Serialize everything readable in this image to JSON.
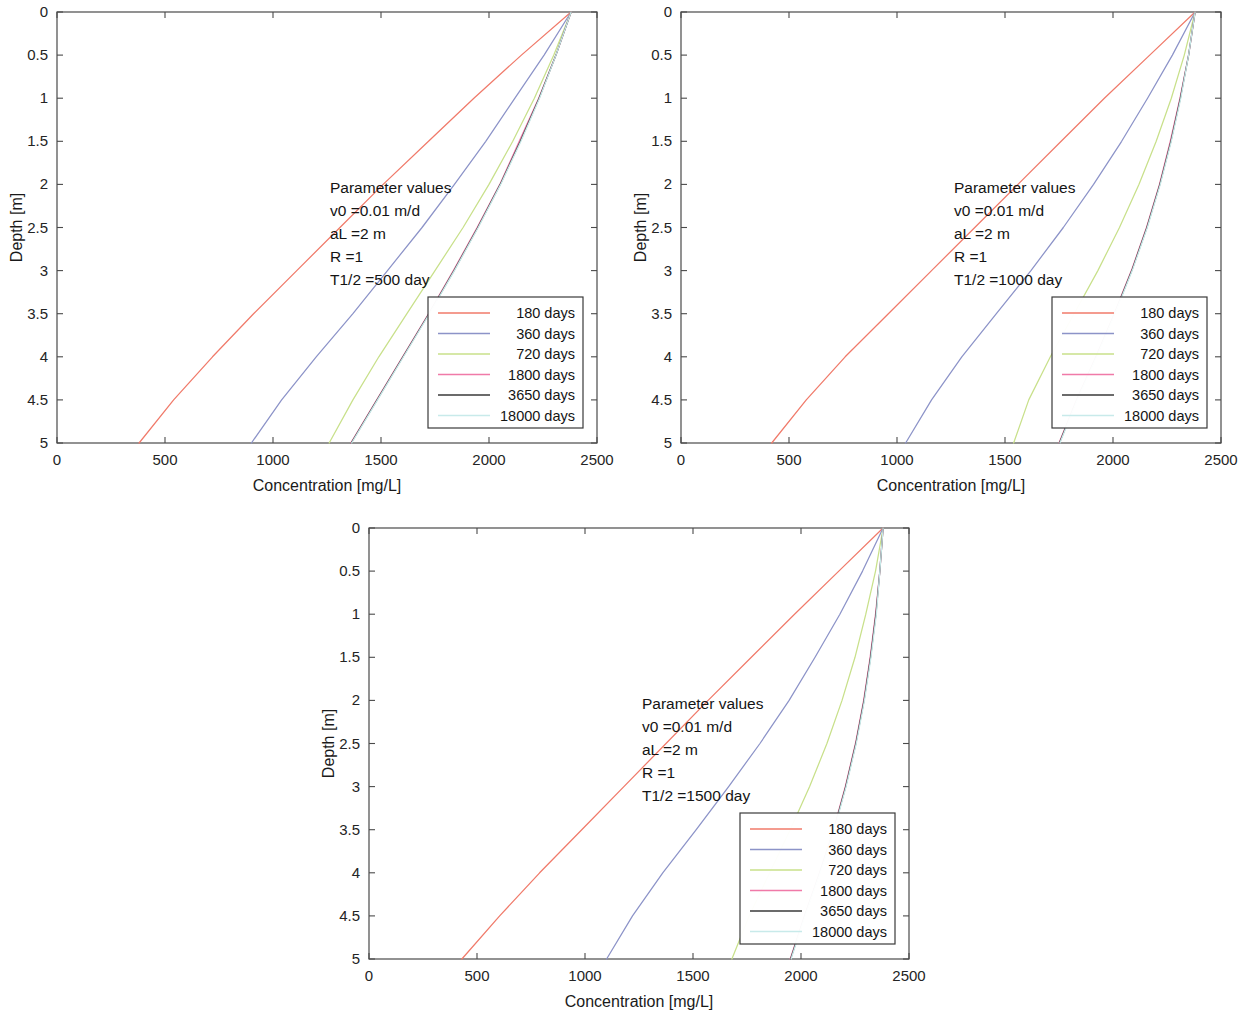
{
  "axes": {
    "xlabel": "Concentration [mg/L]",
    "ylabel": "Depth [m]",
    "xlim": [
      0,
      2500
    ],
    "ylim": [
      0,
      5
    ],
    "xticks": [
      0,
      500,
      1000,
      1500,
      2000,
      2500
    ],
    "xtick_labels": [
      "0",
      "500",
      "1000",
      "1500",
      "2000",
      "2500"
    ],
    "yticks": [
      0,
      0.5,
      1,
      1.5,
      2,
      2.5,
      3,
      3.5,
      4,
      4.5,
      5
    ],
    "ytick_labels": [
      "0",
      "0.5",
      "1",
      "1.5",
      "2",
      "2.5",
      "3",
      "3.5",
      "4",
      "4.5",
      "5"
    ],
    "grid": false
  },
  "series_colors": {
    "180": "#f07a6a",
    "360": "#8c93c8",
    "720": "#c8e08a",
    "1800": "#f07aa8",
    "3650": "#3a3a3a",
    "18000": "#c8eaea"
  },
  "legend": {
    "position": "lower-right-inside",
    "entries": [
      {
        "label": "180 days",
        "color_key": "180"
      },
      {
        "label": "360 days",
        "color_key": "360"
      },
      {
        "label": "720 days",
        "color_key": "720"
      },
      {
        "label": "1800 days",
        "color_key": "1800"
      },
      {
        "label": "3650 days",
        "color_key": "3650"
      },
      {
        "label": "18000 days",
        "color_key": "18000"
      }
    ]
  },
  "panels": [
    {
      "id": "panel-1",
      "param_title": "Parameter values",
      "param_lines": [
        "v0 =0.01 m/d",
        "aL =2 m",
        "R =1",
        "T1/2 =500 day"
      ],
      "half_life_day": 500,
      "chart_data": {
        "type": "line",
        "title": "",
        "xlabel": "Concentration [mg/L]",
        "ylabel": "Depth [m]",
        "xlim": [
          0,
          2500
        ],
        "ylim": [
          0,
          5
        ],
        "y_inverted": true,
        "depths_m": [
          0,
          0.5,
          1,
          1.5,
          2,
          2.5,
          3,
          3.5,
          4,
          4.5,
          5
        ],
        "series": [
          {
            "name": "180 days",
            "values": [
              2380,
              2150,
              1930,
              1720,
              1510,
              1310,
              1110,
              910,
              720,
              540,
              380
            ]
          },
          {
            "name": "360 days",
            "values": [
              2380,
              2255,
              2120,
              1985,
              1840,
              1690,
              1530,
              1370,
              1200,
              1040,
              900
            ]
          },
          {
            "name": "720 days",
            "values": [
              2380,
              2300,
              2210,
              2110,
              2000,
              1880,
              1750,
              1620,
              1490,
              1370,
              1260
            ]
          },
          {
            "name": "1800 days",
            "values": [
              2380,
              2310,
              2230,
              2140,
              2050,
              1945,
              1835,
              1720,
              1600,
              1480,
              1360
            ]
          },
          {
            "name": "3650 days",
            "values": [
              2380,
              2310,
              2232,
              2145,
              2052,
              1948,
              1838,
              1722,
              1602,
              1482,
              1362
            ]
          },
          {
            "name": "18000 days",
            "values": [
              2380,
              2310,
              2234,
              2148,
              2054,
              1950,
              1840,
              1724,
              1604,
              1484,
              1364
            ]
          }
        ]
      }
    },
    {
      "id": "panel-2",
      "param_title": "Parameter values",
      "param_lines": [
        "v0 =0.01 m/d",
        "aL =2 m",
        "R =1",
        "T1/2 =1000 day"
      ],
      "half_life_day": 1000,
      "chart_data": {
        "type": "line",
        "title": "",
        "xlabel": "Concentration [mg/L]",
        "ylabel": "Depth [m]",
        "xlim": [
          0,
          2500
        ],
        "ylim": [
          0,
          5
        ],
        "y_inverted": true,
        "depths_m": [
          0,
          0.5,
          1,
          1.5,
          2,
          2.5,
          3,
          3.5,
          4,
          4.5,
          5
        ],
        "series": [
          {
            "name": "180 days",
            "values": [
              2380,
              2170,
              1960,
              1760,
              1560,
              1360,
              1160,
              960,
              760,
              580,
              420
            ]
          },
          {
            "name": "360 days",
            "values": [
              2380,
              2275,
              2160,
              2040,
              1910,
              1770,
              1620,
              1460,
              1300,
              1160,
              1040
            ]
          },
          {
            "name": "720 days",
            "values": [
              2380,
              2330,
              2270,
              2200,
              2120,
              2030,
              1930,
              1820,
              1710,
              1610,
              1540
            ]
          },
          {
            "name": "1800 days",
            "values": [
              2380,
              2350,
              2310,
              2265,
              2215,
              2155,
              2085,
              2005,
              1920,
              1830,
              1750
            ]
          },
          {
            "name": "3650 days",
            "values": [
              2380,
              2350,
              2312,
              2268,
              2217,
              2157,
              2087,
              2007,
              1922,
              1832,
              1752
            ]
          },
          {
            "name": "18000 days",
            "values": [
              2380,
              2350,
              2314,
              2270,
              2219,
              2159,
              2089,
              2009,
              1924,
              1834,
              1754
            ]
          }
        ]
      }
    },
    {
      "id": "panel-3",
      "param_title": "Parameter values",
      "param_lines": [
        "v0 =0.01 m/d",
        "aL =2 m",
        "R =1",
        "T1/2 =1500 day"
      ],
      "half_life_day": 1500,
      "chart_data": {
        "type": "line",
        "title": "",
        "xlabel": "Concentration [mg/L]",
        "ylabel": "Depth [m]",
        "xlim": [
          0,
          2500
        ],
        "ylim": [
          0,
          5
        ],
        "y_inverted": true,
        "depths_m": [
          0,
          0.5,
          1,
          1.5,
          2,
          2.5,
          3,
          3.5,
          4,
          4.5,
          5
        ],
        "series": [
          {
            "name": "180 days",
            "values": [
              2380,
              2175,
              1970,
              1770,
              1570,
              1375,
              1180,
              985,
              790,
              605,
              430
            ]
          },
          {
            "name": "360 days",
            "values": [
              2380,
              2285,
              2180,
              2065,
              1945,
              1810,
              1665,
              1515,
              1360,
              1220,
              1100
            ]
          },
          {
            "name": "720 days",
            "values": [
              2380,
              2345,
              2300,
              2250,
              2190,
              2120,
              2040,
              1950,
              1855,
              1760,
              1680
            ]
          },
          {
            "name": "1800 days",
            "values": [
              2380,
              2365,
              2345,
              2320,
              2290,
              2252,
              2205,
              2150,
              2085,
              2015,
              1950
            ]
          },
          {
            "name": "3650 days",
            "values": [
              2380,
              2365,
              2347,
              2322,
              2292,
              2254,
              2207,
              2152,
              2087,
              2017,
              1952
            ]
          },
          {
            "name": "18000 days",
            "values": [
              2380,
              2365,
              2349,
              2324,
              2294,
              2256,
              2209,
              2154,
              2089,
              2019,
              1954
            ]
          }
        ]
      }
    }
  ]
}
